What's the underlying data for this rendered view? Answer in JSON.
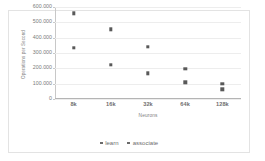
{
  "chart_data": {
    "type": "scatter",
    "title": "",
    "xlabel": "Neurons",
    "ylabel": "Operations per Second",
    "categories": [
      "8k",
      "16k",
      "32k",
      "64k",
      "128k"
    ],
    "ylim": [
      0,
      600000
    ],
    "yticks": [
      0,
      100000,
      200000,
      300000,
      400000,
      500000,
      600000
    ],
    "ytick_labels": [
      "0",
      "100.000",
      "200.000",
      "300.000",
      "400.000",
      "500.000",
      "600.000"
    ],
    "grid": true,
    "legend_position": "bottom",
    "series": [
      {
        "name": "learn",
        "color": "#595959",
        "values": [
          335000,
          222000,
          168000,
          108000,
          62000
        ]
      },
      {
        "name": "associate",
        "color": "#595959",
        "values": [
          560000,
          455000,
          342000,
          196000,
          98000
        ]
      }
    ]
  },
  "legend": {
    "items": [
      {
        "label": "learn"
      },
      {
        "label": "associate"
      }
    ]
  }
}
